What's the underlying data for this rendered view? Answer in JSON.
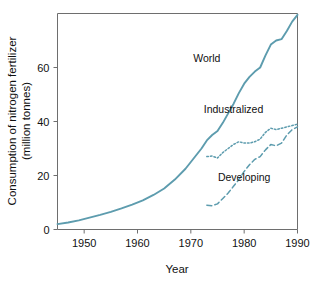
{
  "chart_data": {
    "type": "line",
    "title": "",
    "xlabel": "Year",
    "ylabel": "Consumption of nitrogen fertilizer (million tonnes)",
    "ylabel_line1": "Consumption of nitrogen fertilizer",
    "ylabel_line2": "(million tonnes)",
    "xlim": [
      1945,
      1990
    ],
    "ylim": [
      0,
      80
    ],
    "xticks": [
      1950,
      1960,
      1970,
      1980,
      1990
    ],
    "xtick_labels": [
      "1950",
      "1960",
      "1970",
      "1980",
      "1990"
    ],
    "yticks": [
      0,
      20,
      40,
      60
    ],
    "ytick_labels": [
      "0",
      "20",
      "40",
      "60"
    ],
    "grid": false,
    "legend_position": "inline-annotations",
    "line_color": "#5d9cae",
    "frame_color": "#6e6e6e",
    "series": [
      {
        "name": "World",
        "label": "World",
        "style": "solid",
        "color": "#5d9cae",
        "label_x": 1973,
        "label_y": 62,
        "x": [
          1945,
          1947,
          1949,
          1951,
          1953,
          1955,
          1957,
          1959,
          1961,
          1963,
          1965,
          1967,
          1969,
          1970,
          1971,
          1972,
          1973,
          1974,
          1975,
          1976,
          1977,
          1978,
          1979,
          1980,
          1981,
          1982,
          1983,
          1984,
          1985,
          1986,
          1987,
          1988,
          1989,
          1990
        ],
        "values": [
          2.0,
          2.6,
          3.4,
          4.4,
          5.4,
          6.5,
          7.8,
          9.2,
          10.8,
          12.8,
          15.2,
          18.5,
          22.5,
          25.0,
          27.5,
          30.0,
          33.0,
          35.0,
          36.5,
          39.5,
          43.0,
          46.5,
          50.5,
          54.0,
          56.5,
          58.5,
          60.0,
          64.5,
          68.5,
          70.0,
          70.5,
          73.5,
          77.0,
          79.5
        ]
      },
      {
        "name": "Industralized",
        "label": "Industralized",
        "style": "dotted",
        "color": "#5d9cae",
        "label_x": 1978,
        "label_y": 43,
        "x": [
          1973,
          1974,
          1975,
          1976,
          1977,
          1978,
          1979,
          1980,
          1981,
          1982,
          1983,
          1984,
          1985,
          1986,
          1987,
          1988,
          1989,
          1990
        ],
        "values": [
          27.0,
          27.2,
          26.5,
          28.5,
          30.0,
          31.5,
          32.5,
          32.0,
          32.0,
          32.5,
          33.5,
          36.0,
          37.5,
          37.0,
          37.5,
          38.0,
          38.5,
          39.0
        ]
      },
      {
        "name": "Developing",
        "label": "Developing",
        "style": "dashed",
        "color": "#5d9cae",
        "label_x": 1980,
        "label_y": 18,
        "x": [
          1973,
          1974,
          1975,
          1976,
          1977,
          1978,
          1979,
          1980,
          1981,
          1982,
          1983,
          1984,
          1985,
          1986,
          1987,
          1988,
          1989,
          1990
        ],
        "values": [
          9.0,
          8.8,
          9.5,
          11.5,
          13.5,
          16.0,
          18.5,
          21.5,
          24.0,
          26.0,
          27.0,
          29.5,
          31.5,
          31.0,
          32.0,
          35.0,
          37.0,
          38.0
        ]
      }
    ]
  }
}
